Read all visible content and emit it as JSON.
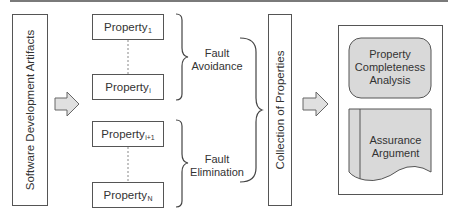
{
  "diagram": {
    "artifacts_box": {
      "label": "Software Development Artifacts"
    },
    "properties": [
      {
        "base": "Property",
        "sub": "1"
      },
      {
        "base": "Property",
        "sub": "i"
      },
      {
        "base": "Property",
        "sub": "i+1"
      },
      {
        "base": "Property",
        "sub": "N"
      }
    ],
    "groups": [
      {
        "line1": "Fault",
        "line2": "Avoidance"
      },
      {
        "line1": "Fault",
        "line2": "Elimination"
      }
    ],
    "collection_box": {
      "label": "Collection of Properties"
    },
    "output_box": {
      "analysis": {
        "line1": "Property",
        "line2": "Completeness",
        "line3": "Analysis"
      },
      "argument": {
        "line1": "Assurance",
        "line2": "Argument"
      }
    },
    "colors": {
      "stroke": "#555555",
      "fill_gray": "#d9d9d9",
      "arrow_fill": "#e0e0e0"
    }
  }
}
